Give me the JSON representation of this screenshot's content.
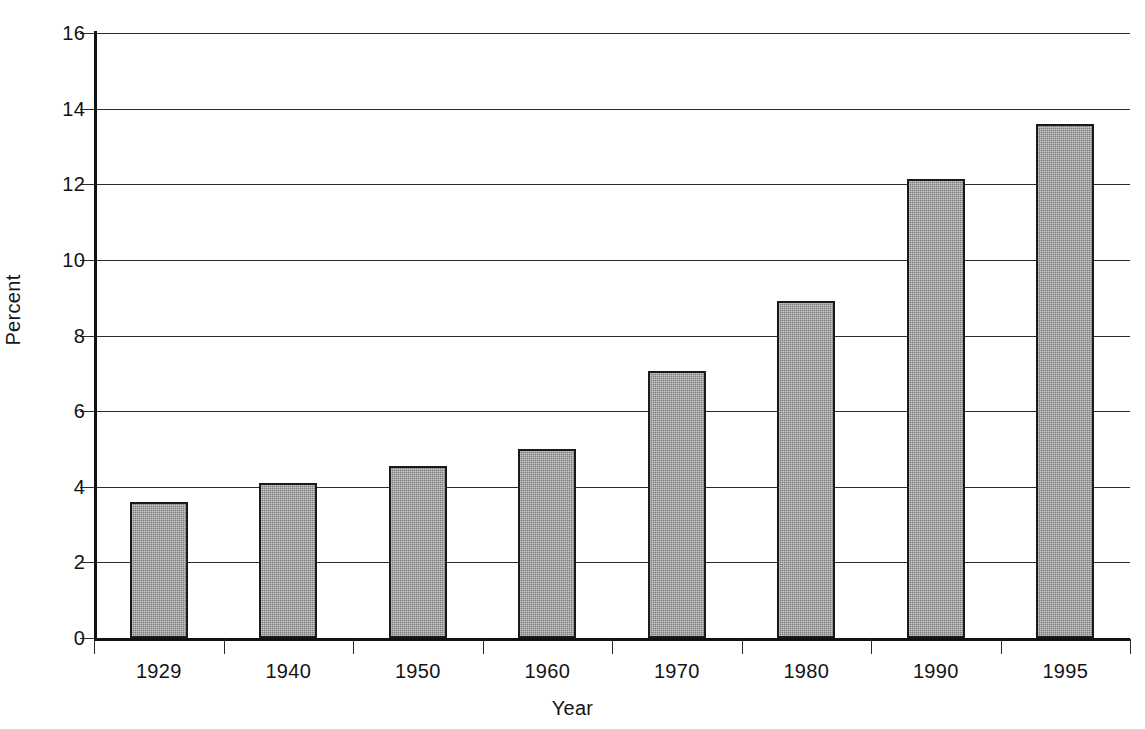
{
  "chart_data": {
    "type": "bar",
    "title": "",
    "subtitle": "",
    "xlabel": "Year",
    "ylabel": "Percent",
    "categories": [
      "1929",
      "1940",
      "1950",
      "1960",
      "1970",
      "1980",
      "1990",
      "1995"
    ],
    "values": [
      3.6,
      4.1,
      4.55,
      5.0,
      7.05,
      8.9,
      12.15,
      13.6
    ],
    "series": [
      {
        "name": "Percent",
        "values": [
          3.6,
          4.1,
          4.55,
          5.0,
          7.05,
          8.9,
          12.15,
          13.6
        ]
      }
    ],
    "ylim": [
      0,
      16
    ],
    "ytick_labels": [
      "0",
      "2",
      "4",
      "6",
      "8",
      "10",
      "12",
      "14",
      "16"
    ],
    "ytick_values": [
      0,
      2,
      4,
      6,
      8,
      10,
      12,
      14,
      16
    ],
    "grid": "horizontal",
    "legend": "none",
    "bar_fill_color": "#7e7e7e",
    "bar_edge_color": "#1a1a1a",
    "axis_color": "#2b2b2b",
    "background_color": "#ffffff",
    "annotations": []
  },
  "axes": {
    "x_title": "Year",
    "y_title": "Percent"
  }
}
